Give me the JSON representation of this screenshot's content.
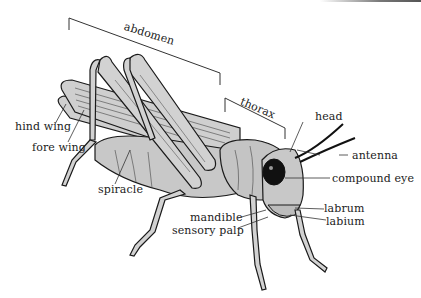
{
  "diagram": {
    "labels": {
      "abdomen": "abdomen",
      "thorax": "thorax",
      "head": "head",
      "antenna": "antenna",
      "compound_eye": "compound eye",
      "hind_wing": "hind wing",
      "fore_wing": "fore wing",
      "spiracle": "spiracle",
      "mandible": "mandible",
      "sensory_palp": "sensory palp",
      "labrum": "labrum",
      "labium": "labium"
    },
    "colors": {
      "body_fill": "#cfcfcf",
      "outline": "#1a1a1a",
      "leader_line": "#333333",
      "background": "#ffffff"
    }
  }
}
